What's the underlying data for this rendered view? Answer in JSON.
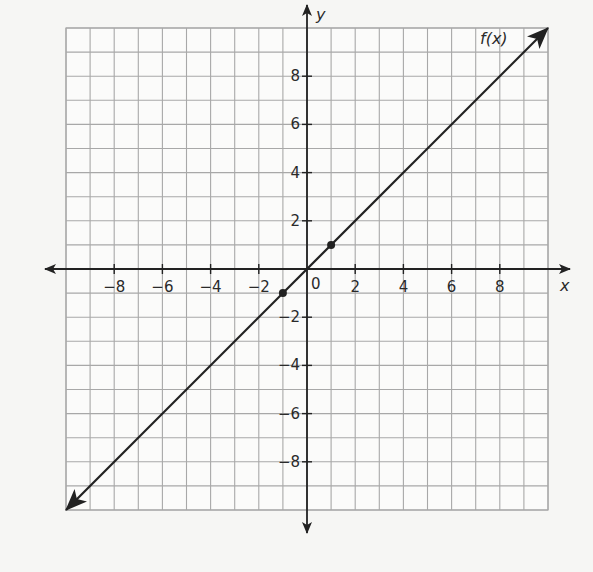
{
  "chart_data": {
    "type": "line",
    "title": "",
    "xlabel": "x",
    "ylabel": "y",
    "xlim": [
      -10,
      10
    ],
    "ylim": [
      -10,
      10
    ],
    "grid": true,
    "grid_step": 1,
    "x_ticks": [
      -8,
      -6,
      -4,
      -2,
      2,
      4,
      6,
      8
    ],
    "y_ticks": [
      -8,
      -6,
      -4,
      -2,
      2,
      4,
      6,
      8
    ],
    "x_tick_labels": [
      "−8",
      "−6",
      "−4",
      "−2",
      "2",
      "4",
      "6",
      "8"
    ],
    "y_tick_labels": [
      "−8",
      "−6",
      "−4",
      "−2",
      "2",
      "4",
      "6",
      "8"
    ],
    "origin_label": "0",
    "series": [
      {
        "name": "f(x)",
        "label": "f(x)",
        "equation": "f(x) = x",
        "x": [
          -10,
          10
        ],
        "y": [
          -10,
          10
        ],
        "arrows_both_ends": true
      }
    ],
    "points": [
      {
        "x": -1,
        "y": -1
      },
      {
        "x": 1,
        "y": 1
      }
    ],
    "colors": {
      "line": "#222222",
      "grid": "#a8a8a8",
      "background": "#f6f6f4"
    }
  }
}
